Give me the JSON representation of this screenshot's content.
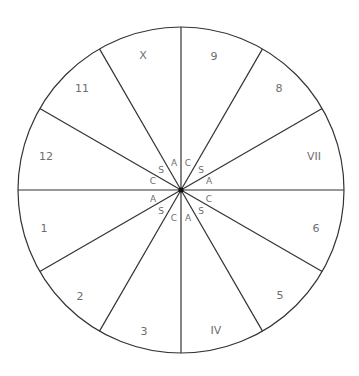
{
  "diagram": {
    "type": "dial",
    "center": [
      181,
      190
    ],
    "radius": 163,
    "segment_count": 12,
    "stroke_color": "#333333",
    "label_color": "#6e6e6e",
    "segments": [
      {
        "label": "9",
        "pos": [
          214,
          56
        ]
      },
      {
        "label": "8",
        "pos": [
          279,
          88
        ]
      },
      {
        "label": "VII",
        "pos": [
          314,
          156
        ]
      },
      {
        "label": "6",
        "pos": [
          316,
          228
        ]
      },
      {
        "label": "5",
        "pos": [
          280,
          295
        ]
      },
      {
        "label": "IV",
        "pos": [
          216,
          330
        ]
      },
      {
        "label": "3",
        "pos": [
          144,
          331
        ]
      },
      {
        "label": "2",
        "pos": [
          80,
          296
        ]
      },
      {
        "label": "1",
        "pos": [
          44,
          228
        ]
      },
      {
        "label": "12",
        "pos": [
          46,
          156
        ]
      },
      {
        "label": "11",
        "pos": [
          82,
          88
        ]
      },
      {
        "label": "X",
        "pos": [
          143,
          55
        ]
      }
    ],
    "inner_labels": [
      {
        "label": "A",
        "pos": [
          174,
          163
        ]
      },
      {
        "label": "C",
        "pos": [
          188,
          163
        ]
      },
      {
        "label": "S",
        "pos": [
          201,
          170
        ]
      },
      {
        "label": "A",
        "pos": [
          209,
          181
        ]
      },
      {
        "label": "C",
        "pos": [
          209,
          199
        ]
      },
      {
        "label": "S",
        "pos": [
          201,
          211
        ]
      },
      {
        "label": "A",
        "pos": [
          188,
          218
        ]
      },
      {
        "label": "C",
        "pos": [
          174,
          218
        ]
      },
      {
        "label": "S",
        "pos": [
          161,
          211
        ]
      },
      {
        "label": "A",
        "pos": [
          153,
          199
        ]
      },
      {
        "label": "C",
        "pos": [
          153,
          181
        ]
      },
      {
        "label": "S",
        "pos": [
          161,
          170
        ]
      }
    ]
  }
}
